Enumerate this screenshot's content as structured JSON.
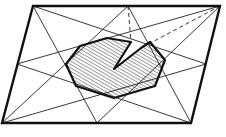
{
  "figure": {
    "description": "Parallelogram with lines joining each vertex to the midpoints of non-adjacent sides and the opposite vertex, forming an inner octagon with a shaded region and a notch (dashed construction lines).",
    "colors": {
      "stroke": "#111111",
      "hatch": "#555555",
      "background": "#ffffff"
    },
    "vertices": {
      "A_top_left": [
        33,
        6
      ],
      "B_top_right": [
        220,
        6
      ],
      "C_bottom_right": [
        191,
        123
      ],
      "D_bottom_left": [
        2,
        123
      ]
    },
    "midpoints": {
      "top": [
        128,
        6
      ],
      "right": [
        206,
        64
      ],
      "bottom": [
        97,
        123
      ],
      "left": [
        17,
        64
      ]
    },
    "octagon": [
      [
        80,
        46
      ],
      [
        107,
        38
      ],
      [
        150,
        42
      ],
      [
        165,
        60
      ],
      [
        155,
        86
      ],
      [
        114,
        98
      ],
      [
        76,
        86
      ],
      [
        66,
        64
      ]
    ],
    "notch": {
      "apex": [
        114,
        69
      ],
      "left_arm_end": [
        131,
        42
      ],
      "right_arm_end": [
        141,
        48
      ]
    },
    "dashed_lines": [
      {
        "from": [
          128,
          6
        ],
        "to": [
          131,
          42
        ]
      },
      {
        "from": [
          220,
          6
        ],
        "to": [
          155,
          44
        ]
      }
    ]
  }
}
